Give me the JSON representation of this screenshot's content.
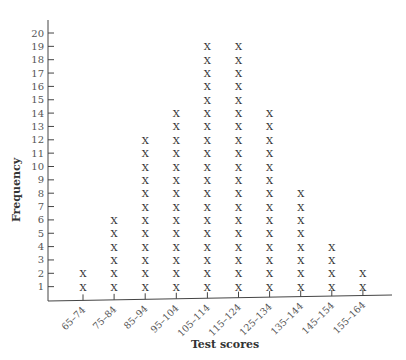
{
  "chart_data": {
    "type": "dot-plot",
    "title": "",
    "xlabel": "Test scores",
    "ylabel": "Frequency",
    "marker": "X",
    "categories": [
      "65–74",
      "75–84",
      "85–94",
      "95–104",
      "105–114",
      "115–124",
      "125–134",
      "135–144",
      "145–154",
      "155–164"
    ],
    "values": [
      2,
      6,
      12,
      14,
      19,
      19,
      14,
      8,
      4,
      2
    ],
    "ylim": [
      0,
      20
    ],
    "yticks": [
      1,
      2,
      3,
      4,
      5,
      6,
      7,
      8,
      9,
      10,
      11,
      12,
      13,
      14,
      15,
      16,
      17,
      18,
      19,
      20
    ],
    "grid": false,
    "legend": null
  }
}
